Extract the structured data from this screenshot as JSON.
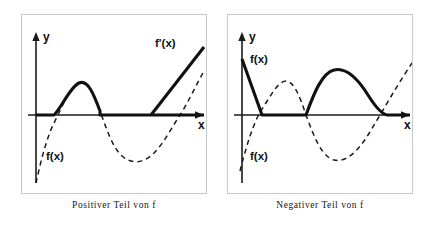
{
  "figure": {
    "background_color": "#ffffff",
    "panel_border_color": "#c9c9c9",
    "ink_color": "#111111"
  },
  "panels": [
    {
      "id": "left",
      "caption": "Positiver Teil von f",
      "axes": {
        "x_label": "x",
        "y_label": "y",
        "x_axis_y": 100,
        "y_axis_x": 14,
        "arrowheads": [
          "x-right",
          "y-up"
        ]
      },
      "labels": [
        {
          "name": "f-prime-label",
          "text": "f'(x)",
          "x": 133,
          "y": 32
        },
        {
          "name": "f-label",
          "text": "f(x)",
          "x": 24,
          "y": 145
        }
      ],
      "curves": [
        {
          "name": "f-dashed",
          "style": "dashed",
          "legend": "f(x)",
          "path": "M 14,168 C 18,150 24,124 32,108 C 40,92 48,72 57,68 C 66,64 72,80 78,96 C 84,112 90,132 100,141 C 110,150 122,148 132,138 C 142,128 150,112 158,100 C 166,88 174,70 182,56"
        },
        {
          "name": "f-positive-solid",
          "style": "solid",
          "legend": "positiver Teil von f",
          "path": "M 14,100 L 32,100 C 40,92 48,72 57,68 C 66,64 72,80 78,96 L 78,100 L 182,100"
        },
        {
          "name": "f-prime-line-solid",
          "style": "solid",
          "legend": "f'(x)",
          "path": "M 129,100 L 182,32"
        }
      ]
    },
    {
      "id": "right",
      "caption": "Negativer Teil von f",
      "axes": {
        "x_label": "x",
        "y_label": "y",
        "x_axis_y": 100,
        "y_axis_x": 14,
        "arrowheads": [
          "x-right",
          "y-up"
        ]
      },
      "labels": [
        {
          "name": "f-label-upper",
          "text": "f(x)",
          "x": 22,
          "y": 48
        },
        {
          "name": "f-label-lower",
          "text": "f(x)",
          "x": 22,
          "y": 145
        }
      ],
      "curves": [
        {
          "name": "f-dashed",
          "style": "dashed",
          "legend": "f(x)",
          "path": "M 12,156 C 18,132 26,106 34,94 C 42,82 50,66 58,66 C 66,66 72,82 78,100 C 86,122 94,142 106,145 C 118,148 130,136 140,120 C 150,104 160,86 170,70 C 175,62 180,54 184,48"
        },
        {
          "name": "f-negative-solid",
          "style": "solid",
          "legend": "negativer Teil von f",
          "path": "M 14,44 L 34,100 L 78,100 C 86,78 94,58 106,55 C 118,52 130,64 140,80 C 150,96 156,100 160,100 L 182,100"
        }
      ]
    }
  ]
}
